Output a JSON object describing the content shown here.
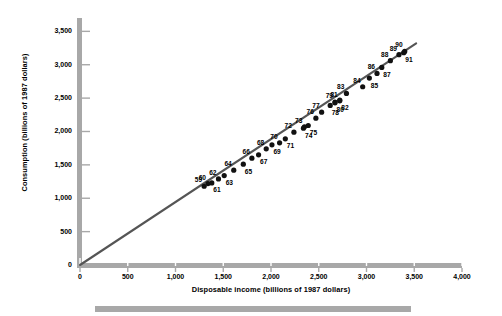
{
  "chart_data": {
    "type": "scatter",
    "title": "",
    "xlabel": "Disposable income (billions of 1987 dollars)",
    "ylabel": "Consumption (billions of 1987 dollars)",
    "xlim": [
      0,
      4000
    ],
    "ylim": [
      0,
      3700
    ],
    "xticks": [
      0,
      500,
      1000,
      1500,
      2000,
      2500,
      3000,
      3500,
      4000
    ],
    "xticklabels": [
      "0",
      "500",
      "1,000",
      "1,500",
      "2,000",
      "2,500",
      "3,000",
      "3,500",
      "4,000"
    ],
    "yticks": [
      0,
      500,
      1000,
      1500,
      2000,
      2500,
      3000,
      3500
    ],
    "yticklabels": [
      "0",
      "500",
      "1,000",
      "1,500",
      "2,000",
      "2,500",
      "3,000",
      "3,500"
    ],
    "grid": false,
    "legend": null,
    "marker_color": "#111111",
    "trendline": {
      "type": "line",
      "color": "#555555",
      "x": [
        0,
        3520
      ],
      "y": [
        0,
        3320
      ]
    },
    "point_label_position": "above-left / below-right alternating",
    "points": [
      {
        "label": "59",
        "x": 1300,
        "y": 1180
      },
      {
        "label": "60",
        "x": 1340,
        "y": 1220
      },
      {
        "label": "61",
        "x": 1380,
        "y": 1230
      },
      {
        "label": "62",
        "x": 1450,
        "y": 1290
      },
      {
        "label": "63",
        "x": 1510,
        "y": 1340
      },
      {
        "label": "64",
        "x": 1610,
        "y": 1420
      },
      {
        "label": "65",
        "x": 1710,
        "y": 1510
      },
      {
        "label": "66",
        "x": 1800,
        "y": 1600
      },
      {
        "label": "67",
        "x": 1870,
        "y": 1650
      },
      {
        "label": "68",
        "x": 1950,
        "y": 1740
      },
      {
        "label": "69",
        "x": 2010,
        "y": 1800
      },
      {
        "label": "70",
        "x": 2090,
        "y": 1830
      },
      {
        "label": "71",
        "x": 2150,
        "y": 1890
      },
      {
        "label": "72",
        "x": 2240,
        "y": 1990
      },
      {
        "label": "73",
        "x": 2350,
        "y": 2070
      },
      {
        "label": "74",
        "x": 2340,
        "y": 2050
      },
      {
        "label": "75",
        "x": 2390,
        "y": 2090
      },
      {
        "label": "76",
        "x": 2470,
        "y": 2200
      },
      {
        "label": "77",
        "x": 2530,
        "y": 2290
      },
      {
        "label": "78",
        "x": 2620,
        "y": 2390
      },
      {
        "label": "79",
        "x": 2670,
        "y": 2440
      },
      {
        "label": "80",
        "x": 2670,
        "y": 2430
      },
      {
        "label": "81",
        "x": 2720,
        "y": 2460
      },
      {
        "label": "82",
        "x": 2720,
        "y": 2470
      },
      {
        "label": "83",
        "x": 2790,
        "y": 2570
      },
      {
        "label": "84",
        "x": 2960,
        "y": 2670
      },
      {
        "label": "85",
        "x": 3030,
        "y": 2800
      },
      {
        "label": "86",
        "x": 3110,
        "y": 2870
      },
      {
        "label": "87",
        "x": 3160,
        "y": 2960
      },
      {
        "label": "88",
        "x": 3250,
        "y": 3060
      },
      {
        "label": "89",
        "x": 3340,
        "y": 3150
      },
      {
        "label": "90",
        "x": 3400,
        "y": 3200
      },
      {
        "label": "91",
        "x": 3390,
        "y": 3180
      }
    ]
  },
  "chart": {
    "xlabel": "Disposable income (billions of 1987 dollars)",
    "ylabel": "Consumption (billions of 1987 dollars)"
  }
}
